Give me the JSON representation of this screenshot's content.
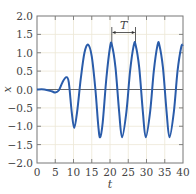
{
  "chart_data": {
    "type": "line",
    "title": "",
    "xlabel": "t",
    "ylabel": "x",
    "xlim": [
      0,
      40
    ],
    "ylim": [
      -2.0,
      2.0
    ],
    "grid": true,
    "xticks": [
      "0",
      "5",
      "10",
      "15",
      "20",
      "25",
      "30",
      "35",
      "40"
    ],
    "yticks": [
      "2.0",
      "1.5",
      "1.0",
      "0.5",
      "0.0",
      "−0.5",
      "−1.0",
      "−1.5",
      "−2.0"
    ],
    "series": [
      {
        "name": "x(t)",
        "color": "#2a5caa",
        "description": "Oscillation growing from rest then settling into periodic motion",
        "points": [
          [
            0,
            0.0
          ],
          [
            2,
            0.0
          ],
          [
            4,
            -0.05
          ],
          [
            5,
            -0.08
          ],
          [
            6,
            -0.02
          ],
          [
            7,
            0.2
          ],
          [
            8,
            0.33
          ],
          [
            8.7,
            0.2
          ],
          [
            9.5,
            -0.6
          ],
          [
            10.2,
            -1.05
          ],
          [
            11,
            -0.6
          ],
          [
            12,
            0.3
          ],
          [
            13,
            1.0
          ],
          [
            14,
            1.22
          ],
          [
            15,
            0.9
          ],
          [
            16,
            0.0
          ],
          [
            16.8,
            -1.0
          ],
          [
            17.3,
            -1.3
          ],
          [
            18,
            -0.9
          ],
          [
            19,
            0.3
          ],
          [
            20,
            1.15
          ],
          [
            20.5,
            1.22
          ],
          [
            21.5,
            0.6
          ],
          [
            22.5,
            -0.6
          ],
          [
            23.3,
            -1.3
          ],
          [
            24.5,
            -0.6
          ],
          [
            25.5,
            0.5
          ],
          [
            26.5,
            1.2
          ],
          [
            27,
            1.22
          ],
          [
            28,
            0.6
          ],
          [
            29,
            -0.6
          ],
          [
            29.8,
            -1.3
          ],
          [
            31,
            -0.6
          ],
          [
            32,
            0.5
          ],
          [
            33,
            1.2
          ],
          [
            33.5,
            1.22
          ],
          [
            34.5,
            0.6
          ],
          [
            35.5,
            -0.6
          ],
          [
            36.3,
            -1.3
          ],
          [
            37.5,
            -0.6
          ],
          [
            38.5,
            0.5
          ],
          [
            39.5,
            1.15
          ],
          [
            40,
            1.22
          ]
        ],
        "peak_value": 1.22,
        "trough_value": -1.3
      }
    ],
    "annotations": [
      {
        "text": "T",
        "type": "period-arrow",
        "from_t": 20.5,
        "to_t": 27,
        "y": 1.55
      }
    ]
  }
}
